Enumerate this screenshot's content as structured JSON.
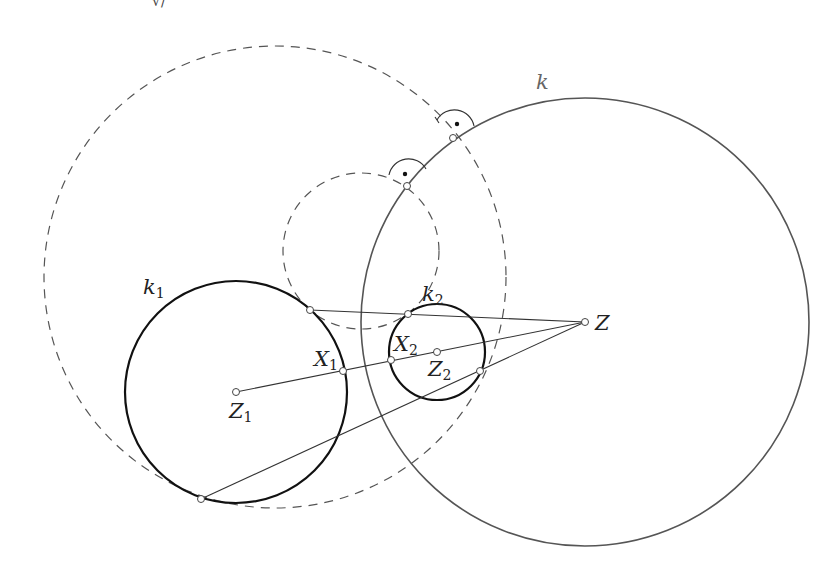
{
  "figure": {
    "width": 833,
    "height": 579,
    "colors": {
      "solid_thick": "#111111",
      "solid_k": "#555555",
      "dashed": "#555555",
      "line": "#333333",
      "point_fill": "#ffffff"
    }
  },
  "circles": {
    "k": {
      "label": "k",
      "cx": 585,
      "cy": 322,
      "r": 224
    },
    "k1": {
      "label": "k",
      "sub": "1",
      "cx": 236,
      "cy": 392,
      "r": 111
    },
    "k2": {
      "label": "k",
      "sub": "2",
      "cx": 437,
      "cy": 352,
      "r": 48
    },
    "dashed_big": {
      "cx": 275,
      "cy": 277,
      "r": 231
    },
    "dashed_small": {
      "cx": 361,
      "cy": 251,
      "r": 78
    }
  },
  "points": {
    "Z": {
      "label": "Z",
      "x": 585,
      "y": 322
    },
    "Z1": {
      "label": "Z",
      "sub": "1",
      "x": 236,
      "y": 392
    },
    "Z2": {
      "label": "Z",
      "sub": "2",
      "x": 437,
      "y": 352
    },
    "X1": {
      "label": "X",
      "sub": "1",
      "x": 343,
      "y": 371
    },
    "X2": {
      "label": "X",
      "sub": "2",
      "x": 391,
      "y": 360
    },
    "T1": {
      "x": 310,
      "y": 310
    },
    "T2": {
      "x": 408,
      "y": 314
    },
    "T3": {
      "x": 201,
      "y": 499
    },
    "T4": {
      "x": 480,
      "y": 371
    },
    "P1": {
      "x": 453,
      "y": 138
    },
    "P2": {
      "x": 407,
      "y": 186
    }
  },
  "labels": {
    "k": {
      "text": "k",
      "x": 536,
      "y": 89
    },
    "k1": {
      "text": "k",
      "sub": "1",
      "x": 143,
      "y": 294
    },
    "k2": {
      "text": "k",
      "sub": "2",
      "x": 422,
      "y": 301
    },
    "Z": {
      "text": "Z",
      "x": 595,
      "y": 330
    },
    "Z1": {
      "text": "Z",
      "sub": "1",
      "x": 229,
      "y": 418
    },
    "Z2": {
      "text": "Z",
      "sub": "2",
      "x": 428,
      "y": 376
    },
    "X1": {
      "text": "X",
      "sub": "1",
      "x": 314,
      "y": 366
    },
    "X2": {
      "text": "X",
      "sub": "2",
      "x": 394,
      "y": 351
    }
  },
  "top_fragment": "√/"
}
